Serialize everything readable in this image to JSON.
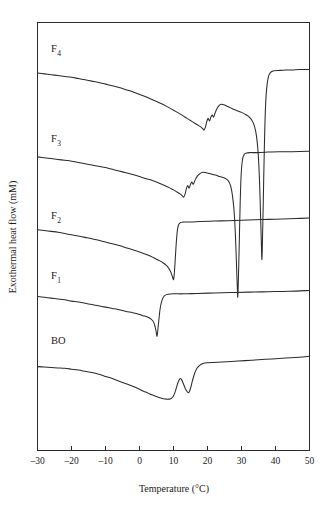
{
  "figure": {
    "background_color": "#ffffff",
    "line_color": "#2b2b2b",
    "text_color": "#1a1a1a"
  },
  "chart_data": {
    "type": "line",
    "title": "",
    "subtitle": "",
    "xlabel": "Temperature (°C)",
    "ylabel": "Exothermal heat flow (mM)",
    "xlim": [
      -30,
      50
    ],
    "ylim": [
      0,
      100
    ],
    "xticks": [
      -30,
      -20,
      -10,
      0,
      10,
      20,
      30,
      40,
      50
    ],
    "xticklabels": [
      "–30",
      "–20",
      "–10",
      "0",
      "10",
      "20",
      "30",
      "40",
      "50"
    ],
    "yticks": [],
    "yticklabels": [],
    "grid": false,
    "legend": "none",
    "y_axis_visible_ticks": false,
    "annotations": [
      {
        "text": "F",
        "sub": "4",
        "x": -26,
        "y": 93
      },
      {
        "text": "F",
        "sub": "3",
        "x": -26,
        "y": 72
      },
      {
        "text": "F",
        "sub": "2",
        "x": -26,
        "y": 54
      },
      {
        "text": "F",
        "sub": "1",
        "x": -26,
        "y": 40
      },
      {
        "text": "BO",
        "sub": "",
        "x": -26,
        "y": 25
      }
    ],
    "series": [
      {
        "name": "F4",
        "label": "F₄",
        "baseline_offset": 86,
        "points": [
          [
            -30,
            88.2
          ],
          [
            -28,
            88.0
          ],
          [
            -26,
            87.8
          ],
          [
            -24,
            87.6
          ],
          [
            -22,
            87.4
          ],
          [
            -20,
            87.2
          ],
          [
            -18,
            86.9
          ],
          [
            -16,
            86.6
          ],
          [
            -14,
            86.3
          ],
          [
            -12,
            86.0
          ],
          [
            -10,
            85.6
          ],
          [
            -8,
            85.2
          ],
          [
            -6,
            84.8
          ],
          [
            -4,
            84.3
          ],
          [
            -2,
            83.8
          ],
          [
            0,
            83.2
          ],
          [
            2,
            82.6
          ],
          [
            4,
            81.9
          ],
          [
            6,
            81.2
          ],
          [
            8,
            80.4
          ],
          [
            10,
            79.5
          ],
          [
            12,
            78.6
          ],
          [
            14,
            77.6
          ],
          [
            15,
            77.1
          ],
          [
            16,
            76.6
          ],
          [
            17,
            76.1
          ],
          [
            18,
            75.6
          ],
          [
            18.6,
            75.2
          ],
          [
            19.0,
            74.9
          ],
          [
            19.4,
            75.6
          ],
          [
            19.8,
            76.9
          ],
          [
            20.2,
            77.6
          ],
          [
            20.6,
            77.0
          ],
          [
            21.0,
            77.9
          ],
          [
            21.4,
            78.4
          ],
          [
            21.8,
            77.9
          ],
          [
            22.2,
            78.8
          ],
          [
            22.8,
            79.9
          ],
          [
            23.4,
            80.6
          ],
          [
            24.0,
            80.9
          ],
          [
            24.8,
            80.8
          ],
          [
            25.6,
            80.5
          ],
          [
            26.4,
            80.2
          ],
          [
            27.2,
            79.9
          ],
          [
            28.0,
            79.6
          ],
          [
            29.0,
            79.3
          ],
          [
            30.0,
            79.0
          ],
          [
            31.0,
            78.6
          ],
          [
            32.0,
            78.1
          ],
          [
            33.0,
            77.2
          ],
          [
            33.8,
            75.8
          ],
          [
            34.4,
            73.5
          ],
          [
            34.9,
            69.5
          ],
          [
            35.3,
            63.0
          ],
          [
            35.6,
            55.0
          ],
          [
            35.85,
            48.0
          ],
          [
            36.0,
            44.6
          ],
          [
            36.15,
            48.5
          ],
          [
            36.4,
            58.0
          ],
          [
            36.7,
            70.0
          ],
          [
            37.0,
            79.0
          ],
          [
            37.4,
            84.6
          ],
          [
            37.9,
            87.3
          ],
          [
            38.5,
            88.3
          ],
          [
            39.5,
            88.7
          ],
          [
            41,
            88.8
          ],
          [
            43,
            88.9
          ],
          [
            45,
            88.9
          ],
          [
            47,
            89.0
          ],
          [
            50,
            89.0
          ]
        ]
      },
      {
        "name": "F3",
        "label": "F₃",
        "baseline_offset": 66,
        "points": [
          [
            -30,
            68.6
          ],
          [
            -28,
            68.4
          ],
          [
            -26,
            68.2
          ],
          [
            -24,
            68.0
          ],
          [
            -22,
            67.8
          ],
          [
            -20,
            67.6
          ],
          [
            -18,
            67.3
          ],
          [
            -16,
            67.0
          ],
          [
            -14,
            66.7
          ],
          [
            -12,
            66.4
          ],
          [
            -10,
            66.1
          ],
          [
            -8,
            65.7
          ],
          [
            -6,
            65.3
          ],
          [
            -4,
            64.9
          ],
          [
            -2,
            64.5
          ],
          [
            0,
            64.0
          ],
          [
            2,
            63.5
          ],
          [
            4,
            63.0
          ],
          [
            6,
            62.4
          ],
          [
            8,
            61.7
          ],
          [
            9,
            61.3
          ],
          [
            10,
            60.9
          ],
          [
            11,
            60.4
          ],
          [
            12,
            59.9
          ],
          [
            12.6,
            59.5
          ],
          [
            13.0,
            59.2
          ],
          [
            13.4,
            59.9
          ],
          [
            13.8,
            61.2
          ],
          [
            14.2,
            61.9
          ],
          [
            14.6,
            61.3
          ],
          [
            15.0,
            62.2
          ],
          [
            15.4,
            62.7
          ],
          [
            15.8,
            62.2
          ],
          [
            16.3,
            63.1
          ],
          [
            17.0,
            64.1
          ],
          [
            17.8,
            64.7
          ],
          [
            18.6,
            65.0
          ],
          [
            19.6,
            64.9
          ],
          [
            20.6,
            64.7
          ],
          [
            21.6,
            64.5
          ],
          [
            22.6,
            64.3
          ],
          [
            23.6,
            64.0
          ],
          [
            24.6,
            63.8
          ],
          [
            25.6,
            63.4
          ],
          [
            26.2,
            62.9
          ],
          [
            26.8,
            61.8
          ],
          [
            27.3,
            59.8
          ],
          [
            27.8,
            56.2
          ],
          [
            28.2,
            50.5
          ],
          [
            28.5,
            44.0
          ],
          [
            28.75,
            38.5
          ],
          [
            28.9,
            35.8
          ],
          [
            29.05,
            38.8
          ],
          [
            29.3,
            47.0
          ],
          [
            29.6,
            57.5
          ],
          [
            29.9,
            64.5
          ],
          [
            30.3,
            68.0
          ],
          [
            30.8,
            69.2
          ],
          [
            31.5,
            69.5
          ],
          [
            32.5,
            69.6
          ],
          [
            34,
            69.6
          ],
          [
            37,
            69.7
          ],
          [
            41,
            69.8
          ],
          [
            45,
            69.8
          ],
          [
            50,
            69.9
          ]
        ]
      },
      {
        "name": "F2",
        "label": "F₂",
        "baseline_offset": 48,
        "points": [
          [
            -30,
            51.6
          ],
          [
            -28,
            51.4
          ],
          [
            -26,
            51.2
          ],
          [
            -24,
            51.0
          ],
          [
            -22,
            50.7
          ],
          [
            -20,
            50.4
          ],
          [
            -18,
            50.1
          ],
          [
            -16,
            49.8
          ],
          [
            -14,
            49.5
          ],
          [
            -12,
            49.1
          ],
          [
            -10,
            48.7
          ],
          [
            -8,
            48.3
          ],
          [
            -6,
            47.9
          ],
          [
            -4,
            47.4
          ],
          [
            -2,
            46.9
          ],
          [
            0,
            46.4
          ],
          [
            2,
            45.8
          ],
          [
            3,
            45.5
          ],
          [
            4,
            45.1
          ],
          [
            5,
            44.7
          ],
          [
            6,
            44.3
          ],
          [
            7,
            43.8
          ],
          [
            7.8,
            43.3
          ],
          [
            8.4,
            42.8
          ],
          [
            8.9,
            42.2
          ],
          [
            9.3,
            41.5
          ],
          [
            9.6,
            40.8
          ],
          [
            9.85,
            40.2
          ],
          [
            10.0,
            39.9
          ],
          [
            10.15,
            40.6
          ],
          [
            10.35,
            42.6
          ],
          [
            10.6,
            45.8
          ],
          [
            10.9,
            49.4
          ],
          [
            11.2,
            51.8
          ],
          [
            11.6,
            52.9
          ],
          [
            12.2,
            53.3
          ],
          [
            13.0,
            53.4
          ],
          [
            15,
            53.4
          ],
          [
            18,
            53.5
          ],
          [
            22,
            53.6
          ],
          [
            26,
            53.7
          ],
          [
            30,
            53.8
          ],
          [
            34,
            53.9
          ],
          [
            38,
            54.0
          ],
          [
            42,
            54.1
          ],
          [
            46,
            54.2
          ],
          [
            50,
            54.3
          ]
        ]
      },
      {
        "name": "F1",
        "label": "F₁",
        "baseline_offset": 32,
        "points": [
          [
            -30,
            36.0
          ],
          [
            -28,
            35.8
          ],
          [
            -26,
            35.6
          ],
          [
            -24,
            35.4
          ],
          [
            -22,
            35.2
          ],
          [
            -20,
            34.9
          ],
          [
            -18,
            34.7
          ],
          [
            -16,
            34.4
          ],
          [
            -14,
            34.1
          ],
          [
            -12,
            33.8
          ],
          [
            -10,
            33.5
          ],
          [
            -8,
            33.2
          ],
          [
            -6,
            32.9
          ],
          [
            -4,
            32.5
          ],
          [
            -2,
            32.2
          ],
          [
            0,
            31.8
          ],
          [
            1,
            31.5
          ],
          [
            2,
            31.3
          ],
          [
            2.8,
            31.0
          ],
          [
            3.4,
            30.7
          ],
          [
            3.9,
            30.3
          ],
          [
            4.3,
            29.7
          ],
          [
            4.6,
            28.9
          ],
          [
            4.85,
            28.0
          ],
          [
            5.0,
            27.2
          ],
          [
            5.15,
            26.7
          ],
          [
            5.3,
            27.4
          ],
          [
            5.5,
            29.0
          ],
          [
            5.8,
            31.3
          ],
          [
            6.1,
            33.3
          ],
          [
            6.5,
            34.8
          ],
          [
            7.0,
            35.8
          ],
          [
            7.6,
            36.3
          ],
          [
            8.4,
            36.5
          ],
          [
            10,
            36.6
          ],
          [
            13,
            36.6
          ],
          [
            17,
            36.7
          ],
          [
            22,
            36.8
          ],
          [
            27,
            36.9
          ],
          [
            32,
            37.0
          ],
          [
            38,
            37.1
          ],
          [
            44,
            37.2
          ],
          [
            50,
            37.4
          ]
        ]
      },
      {
        "name": "BO",
        "label": "BO",
        "baseline_offset": 14,
        "points": [
          [
            -30,
            19.6
          ],
          [
            -28,
            19.5
          ],
          [
            -26,
            19.4
          ],
          [
            -24,
            19.3
          ],
          [
            -22,
            19.2
          ],
          [
            -20,
            19.0
          ],
          [
            -18,
            18.8
          ],
          [
            -16,
            18.5
          ],
          [
            -14,
            18.2
          ],
          [
            -12,
            17.8
          ],
          [
            -10,
            17.3
          ],
          [
            -8,
            16.8
          ],
          [
            -6,
            16.2
          ],
          [
            -4,
            15.6
          ],
          [
            -2,
            15.0
          ],
          [
            0,
            14.3
          ],
          [
            1,
            13.9
          ],
          [
            2,
            13.6
          ],
          [
            3,
            13.2
          ],
          [
            4,
            12.9
          ],
          [
            5,
            12.6
          ],
          [
            6,
            12.3
          ],
          [
            7,
            12.1
          ],
          [
            8,
            12.0
          ],
          [
            8.6,
            12.0
          ],
          [
            9.2,
            12.1
          ],
          [
            9.8,
            12.5
          ],
          [
            10.3,
            13.3
          ],
          [
            10.8,
            14.5
          ],
          [
            11.2,
            15.6
          ],
          [
            11.6,
            16.4
          ],
          [
            12.0,
            16.8
          ],
          [
            12.4,
            16.5
          ],
          [
            12.9,
            15.6
          ],
          [
            13.4,
            14.6
          ],
          [
            13.9,
            13.9
          ],
          [
            14.3,
            13.5
          ],
          [
            14.7,
            13.8
          ],
          [
            15.1,
            14.8
          ],
          [
            15.6,
            16.4
          ],
          [
            16.2,
            18.0
          ],
          [
            16.9,
            19.2
          ],
          [
            17.7,
            19.9
          ],
          [
            18.6,
            20.3
          ],
          [
            20,
            20.5
          ],
          [
            23,
            20.6
          ],
          [
            27,
            20.8
          ],
          [
            31,
            21.0
          ],
          [
            35,
            21.2
          ],
          [
            39,
            21.4
          ],
          [
            43,
            21.6
          ],
          [
            47,
            21.8
          ],
          [
            50,
            22.0
          ]
        ]
      }
    ]
  }
}
